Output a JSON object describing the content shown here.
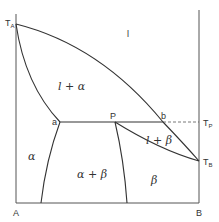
{
  "diagram": {
    "type": "binary phase diagram (peritectic)",
    "axis_labels": {
      "left_bottom": "A",
      "right_bottom": "B"
    },
    "temperature_labels": {
      "TA": {
        "main": "T",
        "sub": "A"
      },
      "TP": {
        "main": "T",
        "sub": "P"
      },
      "TB": {
        "main": "T",
        "sub": "B"
      }
    },
    "points": {
      "a": "a",
      "P": "P",
      "b": "b"
    },
    "regions": {
      "liquid": "l",
      "liquid_alpha": "l + α",
      "alpha": "α",
      "alpha_beta": "α + β",
      "liquid_beta": "l + β",
      "beta": "β"
    }
  }
}
